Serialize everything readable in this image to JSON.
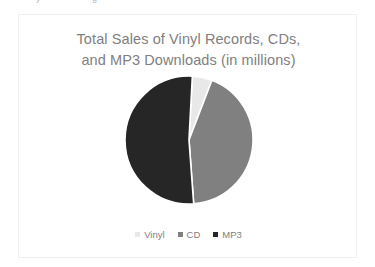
{
  "card": {
    "border_color": "#f0f0f2",
    "background": "#ffffff"
  },
  "artifact": {
    "glyph_one": "y",
    "glyph_two": "g"
  },
  "chart_data": {
    "type": "pie",
    "title": "Total Sales of Vinyl Records, CDs,\nand MP3 Downloads (in millions)",
    "title_line_1": "Total Sales of Vinyl Records, CDs,",
    "title_line_2": "and MP3 Downloads (in millions)",
    "xlabel": "",
    "ylabel": "",
    "units": "millions",
    "legend_position": "bottom",
    "grid": false,
    "start_angle_deg": 3,
    "categories": [
      "Vinyl",
      "CD",
      "MP3"
    ],
    "values": [
      5,
      43,
      52
    ],
    "percentages": [
      "5%",
      "43%",
      "52%"
    ],
    "colors": [
      "#e8e8e8",
      "#808080",
      "#262626"
    ],
    "separator_color": "#ffffff",
    "slices": [
      {
        "label": "Vinyl",
        "value": 5,
        "color": "#e8e8e8"
      },
      {
        "label": "CD",
        "value": 43,
        "color": "#808080"
      },
      {
        "label": "MP3",
        "value": 52,
        "color": "#262626"
      }
    ],
    "legend": [
      {
        "label": "Vinyl",
        "color": "#e8e8e8"
      },
      {
        "label": "CD",
        "color": "#808080"
      },
      {
        "label": "MP3",
        "color": "#262626"
      }
    ]
  }
}
